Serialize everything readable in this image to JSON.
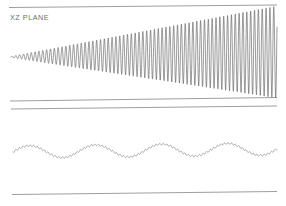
{
  "figure": {
    "background_color": "#ffffff",
    "trace_color": "#5c5c60",
    "rule_color": "#8d8d90",
    "label_color": "#6e6e70",
    "width": 286,
    "height": 206
  },
  "panels": [
    {
      "id": "xz",
      "label": "XZ PLANE",
      "label_x": 10,
      "label_y": 14
    },
    {
      "id": "yz",
      "label": "YZ PLANE",
      "label_x": 10,
      "label_y": 117
    }
  ],
  "rules": [
    {
      "name": "top-rule",
      "x1": 9,
      "y1": 7.5,
      "x2": 277,
      "y2": 5.0
    },
    {
      "name": "xz-bottom-rule",
      "x1": 10,
      "y1": 101.0,
      "x2": 277,
      "y2": 97.5
    },
    {
      "name": "yz-top-rule",
      "x1": 11,
      "y1": 109.0,
      "x2": 277,
      "y2": 106.0
    },
    {
      "name": "yz-bottom-rule",
      "x1": 12,
      "y1": 194.5,
      "x2": 277,
      "y2": 191.5
    }
  ],
  "chart_data": [
    {
      "type": "line",
      "name": "xz-plane-trace",
      "title": "XZ PLANE",
      "description": "Oscillation with linearly growing amplitude envelope (divergent flutter response)",
      "xlabel": "",
      "ylabel": "",
      "x_start": 11,
      "x_end": 277,
      "baseline_y_start": 57.0,
      "baseline_y_end": 52.0,
      "amplitude_start": 0.6,
      "amplitude_end": 46.0,
      "amplitude_growth": "linear",
      "period_px": 3.85,
      "cycles_visible": 69,
      "grid": false,
      "legend": false
    },
    {
      "type": "line",
      "name": "yz-plane-trace",
      "title": "YZ PLANE",
      "description": "Low frequency sine wave with small superimposed high frequency ripple",
      "xlabel": "",
      "ylabel": "",
      "x_start": 13,
      "x_end": 277,
      "baseline_y_start": 152.0,
      "baseline_y_end": 149.0,
      "amplitude_main": 6.2,
      "period_main_px": 66.0,
      "cycles_visible": 4,
      "ripple_amplitude": 0.85,
      "ripple_period_px": 3.6,
      "grid": false,
      "legend": false
    }
  ]
}
